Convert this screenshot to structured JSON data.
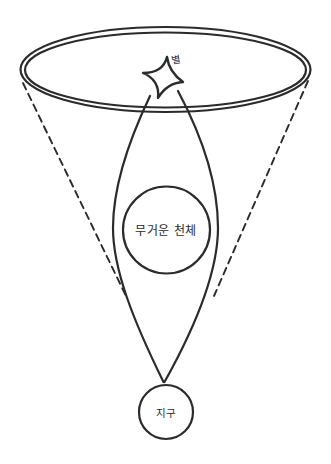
{
  "diagram": {
    "labels": {
      "star": "별",
      "massive_object": "무거운 천체",
      "earth": "지구"
    },
    "colors": {
      "stroke": "#2b2b2b",
      "background": "#ffffff"
    }
  }
}
